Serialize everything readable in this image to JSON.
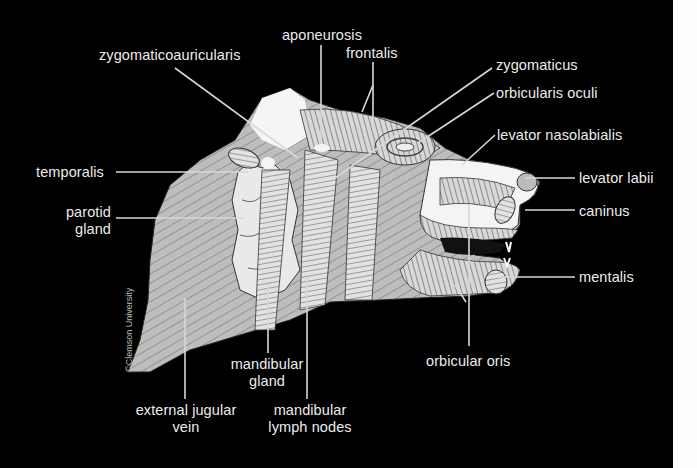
{
  "figure": {
    "colors": {
      "background": "#000000",
      "label_text": "#ececec",
      "leader_line": "#d8d8d8",
      "right_margin": "#fdfdfd"
    },
    "copyright": "©Clemson University"
  },
  "labels": {
    "aponeurosis": "aponeurosis",
    "zygomaticoauricularis": "zygomaticoauricularis",
    "frontalis": "frontalis",
    "zygomaticus": "zygomaticus",
    "orbicularis_oculi": "orbicularis oculi",
    "levator_nasolabialis": "levator nasolabialis",
    "temporalis": "temporalis",
    "levator_labii": "levator labii",
    "parotid_gland_1": "parotid",
    "parotid_gland_2": "gland",
    "caninus": "caninus",
    "mentalis": "mentalis",
    "mandibular_gland_1": "mandibular",
    "mandibular_gland_2": "gland",
    "orbicular_oris": "orbicular oris",
    "external_jugular_vein_1": "external jugular",
    "external_jugular_vein_2": "vein",
    "mandibular_lymph_nodes_1": "mandibular",
    "mandibular_lymph_nodes_2": "lymph nodes"
  }
}
